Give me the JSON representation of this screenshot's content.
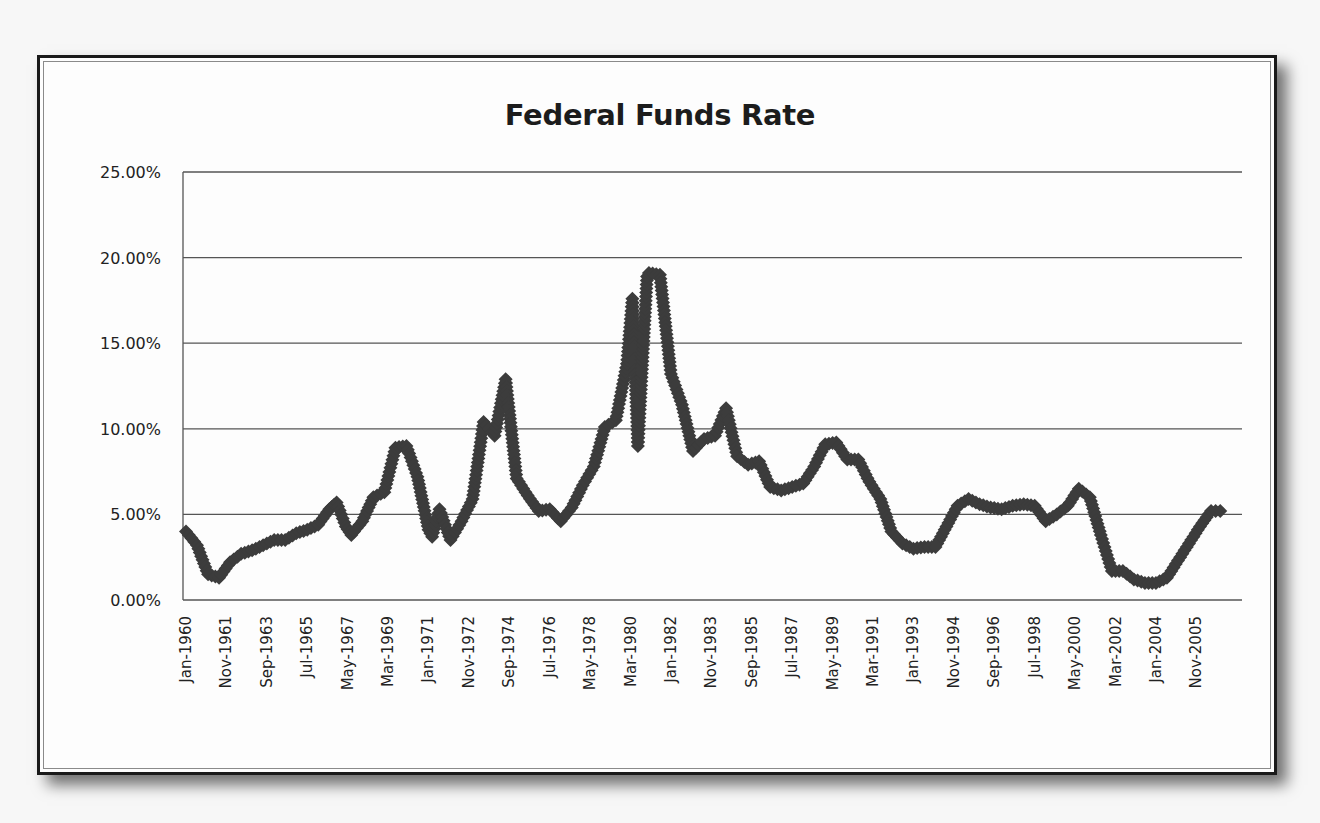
{
  "chart_data": {
    "type": "line",
    "title": "Federal Funds Rate",
    "xlabel": "",
    "ylabel": "",
    "ylim": [
      0,
      25
    ],
    "y_ticks": [
      "0.00%",
      "5.00%",
      "10.00%",
      "15.00%",
      "20.00%",
      "25.00%"
    ],
    "x_tick_labels": [
      "Jan-1960",
      "Nov-1961",
      "Sep-1963",
      "Jul-1965",
      "May-1967",
      "Mar-1969",
      "Jan-1971",
      "Nov-1972",
      "Sep-1974",
      "Jul-1976",
      "May-1978",
      "Mar-1980",
      "Jan-1982",
      "Nov-1983",
      "Sep-1985",
      "Jul-1987",
      "May-1989",
      "Mar-1991",
      "Jan-1993",
      "Nov-1994",
      "Sep-1996",
      "Jul-1998",
      "May-2000",
      "Mar-2002",
      "Jan-2004",
      "Nov-2005"
    ],
    "grid": "horizontal",
    "legend": "none",
    "marker": "diamond",
    "series_color": "#3c3c3c",
    "series": [
      {
        "name": "Federal Funds Rate (%)",
        "points": [
          [
            "Jan-1960",
            4.0
          ],
          [
            "Jul-1960",
            3.2
          ],
          [
            "Jan-1961",
            1.5
          ],
          [
            "Jul-1961",
            1.3
          ],
          [
            "Jan-1962",
            2.2
          ],
          [
            "Jul-1962",
            2.7
          ],
          [
            "Jan-1963",
            2.9
          ],
          [
            "Jul-1963",
            3.2
          ],
          [
            "Jan-1964",
            3.5
          ],
          [
            "Jul-1964",
            3.5
          ],
          [
            "Jan-1965",
            3.9
          ],
          [
            "Jul-1965",
            4.1
          ],
          [
            "Jan-1966",
            4.4
          ],
          [
            "Jul-1966",
            5.3
          ],
          [
            "Nov-1966",
            5.7
          ],
          [
            "Apr-1967",
            4.3
          ],
          [
            "Jul-1967",
            3.8
          ],
          [
            "Jan-1968",
            4.6
          ],
          [
            "Jul-1968",
            6.0
          ],
          [
            "Jan-1969",
            6.3
          ],
          [
            "Jul-1969",
            8.9
          ],
          [
            "Jan-1970",
            9.0
          ],
          [
            "Jul-1970",
            7.2
          ],
          [
            "Jan-1971",
            4.1
          ],
          [
            "Mar-1971",
            3.7
          ],
          [
            "Jul-1971",
            5.3
          ],
          [
            "Jan-1972",
            3.5
          ],
          [
            "Jul-1972",
            4.6
          ],
          [
            "Jan-1973",
            5.9
          ],
          [
            "Jul-1973",
            10.4
          ],
          [
            "Jan-1974",
            9.6
          ],
          [
            "Jul-1974",
            12.9
          ],
          [
            "Jan-1975",
            7.1
          ],
          [
            "Jul-1975",
            6.1
          ],
          [
            "Jan-1976",
            5.2
          ],
          [
            "Jul-1976",
            5.3
          ],
          [
            "Jan-1977",
            4.6
          ],
          [
            "Jul-1977",
            5.4
          ],
          [
            "Jan-1978",
            6.7
          ],
          [
            "Jul-1978",
            7.8
          ],
          [
            "Jan-1979",
            10.1
          ],
          [
            "Jul-1979",
            10.5
          ],
          [
            "Jan-1980",
            13.8
          ],
          [
            "Apr-1980",
            17.6
          ],
          [
            "Jul-1980",
            9.0
          ],
          [
            "Dec-1980",
            18.9
          ],
          [
            "Jan-1981",
            19.1
          ],
          [
            "Jul-1981",
            19.0
          ],
          [
            "Jan-1982",
            13.2
          ],
          [
            "Jul-1982",
            11.4
          ],
          [
            "Jan-1983",
            8.7
          ],
          [
            "Jul-1983",
            9.4
          ],
          [
            "Jan-1984",
            9.6
          ],
          [
            "Jul-1984",
            11.2
          ],
          [
            "Jan-1985",
            8.4
          ],
          [
            "Jul-1985",
            7.9
          ],
          [
            "Jan-1986",
            8.1
          ],
          [
            "Jul-1986",
            6.6
          ],
          [
            "Jan-1987",
            6.4
          ],
          [
            "Jul-1987",
            6.6
          ],
          [
            "Jan-1988",
            6.8
          ],
          [
            "Jul-1988",
            7.8
          ],
          [
            "Jan-1989",
            9.1
          ],
          [
            "Jul-1989",
            9.2
          ],
          [
            "Jan-1990",
            8.2
          ],
          [
            "Jul-1990",
            8.2
          ],
          [
            "Jan-1991",
            6.9
          ],
          [
            "Jul-1991",
            5.9
          ],
          [
            "Jan-1992",
            4.0
          ],
          [
            "Jul-1992",
            3.3
          ],
          [
            "Jan-1993",
            3.0
          ],
          [
            "Jul-1993",
            3.1
          ],
          [
            "Jan-1994",
            3.1
          ],
          [
            "Jul-1994",
            4.3
          ],
          [
            "Jan-1995",
            5.5
          ],
          [
            "Jul-1995",
            5.9
          ],
          [
            "Jan-1996",
            5.6
          ],
          [
            "Jul-1996",
            5.4
          ],
          [
            "Jan-1997",
            5.3
          ],
          [
            "Jul-1997",
            5.5
          ],
          [
            "Jan-1998",
            5.6
          ],
          [
            "Jul-1998",
            5.5
          ],
          [
            "Jan-1999",
            4.6
          ],
          [
            "Jul-1999",
            5.0
          ],
          [
            "Jan-2000",
            5.5
          ],
          [
            "Jul-2000",
            6.5
          ],
          [
            "Jan-2001",
            6.0
          ],
          [
            "Jul-2001",
            3.8
          ],
          [
            "Jan-2002",
            1.7
          ],
          [
            "Jul-2002",
            1.7
          ],
          [
            "Jan-2003",
            1.2
          ],
          [
            "Jul-2003",
            1.0
          ],
          [
            "Jan-2004",
            1.0
          ],
          [
            "Jul-2004",
            1.3
          ],
          [
            "Jan-2005",
            2.3
          ],
          [
            "Jul-2005",
            3.3
          ],
          [
            "Jan-2006",
            4.3
          ],
          [
            "Jul-2006",
            5.2
          ],
          [
            "Dec-2006",
            5.2
          ]
        ]
      }
    ]
  }
}
